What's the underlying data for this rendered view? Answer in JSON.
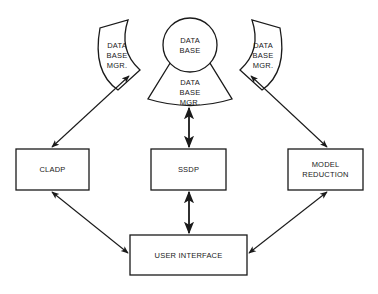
{
  "diagram": {
    "database": {
      "lines": [
        "DATA",
        "BASE"
      ]
    },
    "db_managers": [
      {
        "position": "left",
        "lines": [
          "DATA",
          "BASE",
          "MGR."
        ]
      },
      {
        "position": "right",
        "lines": [
          "DATA",
          "BASE",
          "MGR."
        ]
      },
      {
        "position": "bottom",
        "lines": [
          "DATA",
          "BASE",
          "MGR."
        ]
      }
    ],
    "nodes": {
      "cladp": {
        "label": "CLADP"
      },
      "ssdp": {
        "label": "SSDP"
      },
      "model_reduction": {
        "lines": [
          "MODEL",
          "REDUCTION"
        ]
      },
      "user_interface": {
        "label": "USER INTERFACE"
      }
    },
    "edges": [
      {
        "from": "DATA BASE MGR. (left)",
        "to": "CLADP",
        "type": "bidirectional"
      },
      {
        "from": "DATA BASE MGR. (bottom)",
        "to": "SSDP",
        "type": "bidirectional"
      },
      {
        "from": "DATA BASE MGR. (right)",
        "to": "MODEL REDUCTION",
        "type": "bidirectional"
      },
      {
        "from": "CLADP",
        "to": "USER INTERFACE",
        "type": "bidirectional"
      },
      {
        "from": "SSDP",
        "to": "USER INTERFACE",
        "type": "bidirectional"
      },
      {
        "from": "MODEL REDUCTION",
        "to": "USER INTERFACE",
        "type": "bidirectional"
      }
    ]
  }
}
